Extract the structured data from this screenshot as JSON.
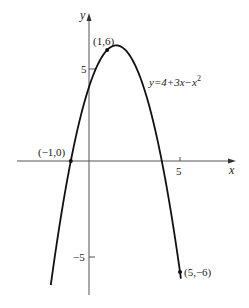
{
  "chart_data": {
    "type": "line",
    "title": "",
    "function_label": "y=4+3x−x",
    "function_label_exp": "2",
    "xlabel": "x",
    "ylabel": "y",
    "x_ticks": [
      {
        "value": 5,
        "label": "5"
      }
    ],
    "y_ticks": [
      {
        "value": 5,
        "label": "5"
      },
      {
        "value": -5,
        "label": "−5"
      }
    ],
    "xlim": [
      -4.9,
      6.7
    ],
    "ylim": [
      -8.4,
      8.2
    ],
    "grid": false,
    "legend": "none",
    "series": [
      {
        "name": "y=4+3x-x^2",
        "x_range": [
          -2.1,
          5.05
        ],
        "expression": "4+3x-x^2"
      }
    ],
    "points": [
      {
        "x": 1,
        "y": 6,
        "label": "(1,6)"
      },
      {
        "x": -1,
        "y": 0,
        "label": "(−1,0)"
      },
      {
        "x": 5,
        "y": -6,
        "label": "(5,−6)"
      }
    ]
  },
  "style": {
    "curve_color": "#111111",
    "axis_color": "#444444",
    "text_color": "#222222"
  }
}
